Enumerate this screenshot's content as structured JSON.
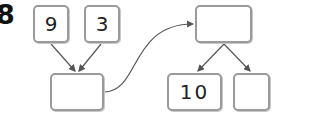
{
  "problem_label": "8",
  "boxes": {
    "input_a": "9",
    "input_b": "3",
    "sum": "",
    "result": "",
    "part_a": "10",
    "part_b": ""
  },
  "colors": {
    "box_border": "#9a9a9a",
    "arrow": "#555555"
  }
}
